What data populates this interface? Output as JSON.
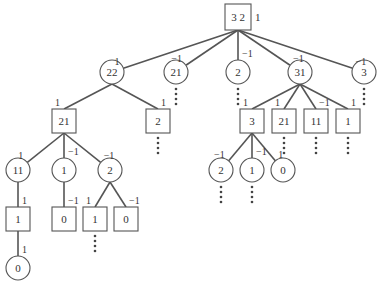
{
  "diagram": {
    "type": "tree",
    "root": {
      "id": "n0",
      "shape": "box",
      "label": "3 2",
      "side_label": "1",
      "x": 238,
      "y": 17
    },
    "nodes": [
      {
        "id": "n1",
        "shape": "circle",
        "label": "22",
        "x": 112,
        "y": 72,
        "parent": "n0",
        "edge_label": "1",
        "continues": false
      },
      {
        "id": "n2",
        "shape": "circle",
        "label": "21",
        "x": 176,
        "y": 72,
        "parent": "n0",
        "edge_label": "−1",
        "continues": true
      },
      {
        "id": "n3",
        "shape": "circle",
        "label": "2",
        "x": 238,
        "y": 72,
        "parent": "n0",
        "edge_label": "−1",
        "continues": true
      },
      {
        "id": "n4",
        "shape": "circle",
        "label": "31",
        "x": 300,
        "y": 72,
        "parent": "n0",
        "edge_label": "−1",
        "continues": false
      },
      {
        "id": "n5",
        "shape": "circle",
        "label": "3",
        "x": 364,
        "y": 72,
        "parent": "n0",
        "edge_label": "−1",
        "continues": true
      },
      {
        "id": "n6",
        "shape": "box",
        "label": "21",
        "x": 64,
        "y": 121,
        "parent": "n1",
        "edge_label": "1",
        "continues": false
      },
      {
        "id": "n7",
        "shape": "box",
        "label": "2",
        "x": 158,
        "y": 121,
        "parent": "n1",
        "edge_label": "1",
        "continues": true
      },
      {
        "id": "n8",
        "shape": "box",
        "label": "3",
        "x": 252,
        "y": 121,
        "parent": "n4",
        "edge_label": "1",
        "continues": false
      },
      {
        "id": "n9",
        "shape": "box",
        "label": "21",
        "x": 284,
        "y": 121,
        "parent": "n4",
        "edge_label": "1",
        "continues": true
      },
      {
        "id": "n10",
        "shape": "box",
        "label": "11",
        "x": 316,
        "y": 121,
        "parent": "n4",
        "edge_label": "−1",
        "continues": true
      },
      {
        "id": "n11",
        "shape": "box",
        "label": "1",
        "x": 348,
        "y": 121,
        "parent": "n4",
        "edge_label": "1",
        "continues": true
      },
      {
        "id": "n12",
        "shape": "circle",
        "label": "11",
        "x": 18,
        "y": 170,
        "parent": "n6",
        "edge_label": "1",
        "continues": false
      },
      {
        "id": "n13",
        "shape": "circle",
        "label": "1",
        "x": 64,
        "y": 170,
        "parent": "n6",
        "edge_label": "−1",
        "continues": false
      },
      {
        "id": "n14",
        "shape": "circle",
        "label": "2",
        "x": 110,
        "y": 170,
        "parent": "n6",
        "edge_label": "−1",
        "continues": false
      },
      {
        "id": "n15",
        "shape": "circle",
        "label": "2",
        "x": 221,
        "y": 170,
        "parent": "n8",
        "edge_label": "−1",
        "continues": true
      },
      {
        "id": "n16",
        "shape": "circle",
        "label": "1",
        "x": 252,
        "y": 170,
        "parent": "n8",
        "edge_label": "−1",
        "continues": true
      },
      {
        "id": "n17",
        "shape": "circle",
        "label": "0",
        "x": 283,
        "y": 170,
        "parent": "n8",
        "edge_label": "1",
        "continues": false
      },
      {
        "id": "n18",
        "shape": "box",
        "label": "1",
        "x": 18,
        "y": 219,
        "parent": "n12",
        "edge_label": "1",
        "continues": false
      },
      {
        "id": "n19",
        "shape": "box",
        "label": "0",
        "x": 64,
        "y": 219,
        "parent": "n13",
        "edge_label": "−1",
        "continues": false
      },
      {
        "id": "n20",
        "shape": "box",
        "label": "1",
        "x": 95,
        "y": 219,
        "parent": "n14",
        "edge_label": "1",
        "continues": true
      },
      {
        "id": "n21",
        "shape": "box",
        "label": "0",
        "x": 126,
        "y": 219,
        "parent": "n14",
        "edge_label": "−1",
        "continues": false
      },
      {
        "id": "n22",
        "shape": "circle",
        "label": "0",
        "x": 18,
        "y": 268,
        "parent": "n18",
        "edge_label": "1",
        "continues": false
      }
    ],
    "colors": {
      "stroke": "#555555",
      "text": "#333333",
      "background": "#ffffff"
    }
  }
}
